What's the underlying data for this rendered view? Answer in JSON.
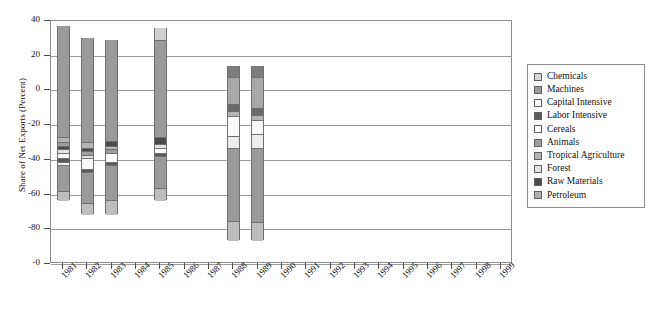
{
  "chart_data": {
    "type": "bar",
    "title": "",
    "subtitle": "",
    "xlabel": "",
    "ylabel": "Share of Net Exports (Percent)",
    "stacked": true,
    "grid": true,
    "legend_position": "right",
    "ylim": [
      -100,
      40
    ],
    "yticks": [
      40,
      20,
      0,
      -20,
      -40,
      -60,
      -80,
      -100
    ],
    "ytick_labels": [
      "40",
      "20",
      "0",
      "-20",
      "-40",
      "-60",
      "-80",
      "-0"
    ],
    "categories": [
      "1981",
      "1982",
      "1983",
      "1984",
      "1985",
      "1986",
      "1987",
      "1988",
      "1989",
      "1990",
      "1991",
      "1992",
      "1993",
      "1994",
      "1995",
      "1996",
      "1997",
      "1998",
      "1999"
    ],
    "series": [
      {
        "name": "Chemicals",
        "color": "#d6d6d6",
        "values": [
          0,
          0,
          0,
          null,
          0,
          null,
          null,
          0,
          0,
          null,
          null,
          null,
          null,
          null,
          null,
          null,
          null,
          null,
          null
        ]
      },
      {
        "name": "Machines",
        "color": "#9a9a9a",
        "values": [
          -67.5,
          -61,
          -62,
          null,
          -58,
          null,
          null,
          -50,
          -52,
          null,
          null,
          null,
          null,
          null,
          null,
          null,
          null,
          null,
          null
        ]
      },
      {
        "name": "Capital Intensive",
        "color": "#f2f2f2",
        "values": [
          0,
          0,
          0,
          null,
          0,
          null,
          null,
          0,
          0,
          null,
          null,
          null,
          null,
          null,
          null,
          null,
          null,
          null,
          null
        ]
      },
      {
        "name": "Labor Intensive",
        "color": "#5a5a5a",
        "values": [
          -2.5,
          -3,
          -3,
          null,
          -3,
          null,
          null,
          -3,
          -3,
          null,
          null,
          null,
          null,
          null,
          null,
          null,
          null,
          null,
          null
        ]
      },
      {
        "name": "Cereals",
        "color": "#fafafa",
        "values": [
          -5,
          -7,
          -6,
          null,
          -3,
          null,
          null,
          -12,
          -12,
          null,
          null,
          null,
          null,
          null,
          null,
          null,
          null,
          null,
          null
        ]
      },
      {
        "name": "Animals",
        "color": "#9e9e9e",
        "values": [
          -2,
          -2,
          -2,
          null,
          -2,
          null,
          null,
          -2,
          -2,
          null,
          null,
          null,
          null,
          null,
          null,
          null,
          null,
          null,
          null
        ]
      },
      {
        "name": "Tropical Agriculture",
        "color": "#b5b5b5",
        "values": [
          -2,
          -2,
          -2,
          null,
          -2,
          null,
          null,
          -2,
          -2,
          null,
          null,
          null,
          null,
          null,
          null,
          null,
          null,
          null,
          null
        ]
      },
      {
        "name": "Forest",
        "color": "#e2e2e2",
        "values": [
          -2,
          -2,
          -2,
          null,
          -2,
          null,
          null,
          -2,
          -2,
          null,
          null,
          null,
          null,
          null,
          null,
          null,
          null,
          null,
          null
        ]
      },
      {
        "name": "Raw Materials",
        "color": "#4a4a4a",
        "values": [
          -2,
          -2,
          -2,
          null,
          -2,
          null,
          null,
          -2,
          -2,
          null,
          null,
          null,
          null,
          null,
          null,
          null,
          null,
          null,
          null
        ]
      },
      {
        "name": "Petroleum",
        "color": "#b0b0b0",
        "values": [
          -17,
          -22,
          -21,
          null,
          -26,
          null,
          null,
          -12,
          -12,
          null,
          null,
          null,
          null,
          null,
          null,
          null,
          null,
          null,
          null
        ]
      }
    ],
    "bars": [
      {
        "year": "1981",
        "top": 37,
        "bottom": -63,
        "segments": [
          {
            "name": "Machines",
            "from": 37,
            "to": -27,
            "color": "#9a9a9a"
          },
          {
            "name": "Tropical Agriculture",
            "from": -27,
            "to": -30,
            "color": "#b5b5b5"
          },
          {
            "name": "Animals",
            "from": -30,
            "to": -32,
            "color": "#9e9e9e"
          },
          {
            "name": "Raw Materials",
            "from": -32,
            "to": -34,
            "color": "#4a4a4a"
          },
          {
            "name": "Forest",
            "from": -34,
            "to": -36,
            "color": "#e2e2e2"
          },
          {
            "name": "Cereals",
            "from": -36,
            "to": -39,
            "color": "#fafafa"
          },
          {
            "name": "Labor Intensive",
            "from": -39,
            "to": -41,
            "color": "#5a5a5a"
          },
          {
            "name": "Capital Intensive",
            "from": -41,
            "to": -43,
            "color": "#f2f2f2"
          },
          {
            "name": "Petroleum",
            "from": -43,
            "to": -58,
            "color": "#9a9a9a"
          },
          {
            "name": "Chemicals",
            "from": -58,
            "to": -63,
            "color": "#bdbdbd"
          }
        ]
      },
      {
        "year": "1982",
        "top": 30,
        "bottom": -71,
        "segments": [
          {
            "name": "Machines",
            "from": 30,
            "to": -30,
            "color": "#9a9a9a"
          },
          {
            "name": "Tropical Agriculture",
            "from": -30,
            "to": -33,
            "color": "#b5b5b5"
          },
          {
            "name": "Raw Materials",
            "from": -33,
            "to": -35,
            "color": "#4a4a4a"
          },
          {
            "name": "Animals",
            "from": -35,
            "to": -37,
            "color": "#9e9e9e"
          },
          {
            "name": "Forest",
            "from": -37,
            "to": -39,
            "color": "#e2e2e2"
          },
          {
            "name": "Cereals",
            "from": -39,
            "to": -45,
            "color": "#fafafa"
          },
          {
            "name": "Labor Intensive",
            "from": -45,
            "to": -47,
            "color": "#5a5a5a"
          },
          {
            "name": "Petroleum",
            "from": -47,
            "to": -65,
            "color": "#9a9a9a"
          },
          {
            "name": "Chemicals",
            "from": -65,
            "to": -71,
            "color": "#bdbdbd"
          }
        ]
      },
      {
        "year": "1983",
        "top": 29,
        "bottom": -71,
        "segments": [
          {
            "name": "Machines",
            "from": 29,
            "to": -29,
            "color": "#9a9a9a"
          },
          {
            "name": "Raw Materials",
            "from": -29,
            "to": -32,
            "color": "#4a4a4a"
          },
          {
            "name": "Tropical Agriculture",
            "from": -32,
            "to": -34,
            "color": "#b5b5b5"
          },
          {
            "name": "Animals",
            "from": -34,
            "to": -36,
            "color": "#9e9e9e"
          },
          {
            "name": "Cereals",
            "from": -36,
            "to": -41,
            "color": "#fafafa"
          },
          {
            "name": "Labor Intensive",
            "from": -41,
            "to": -43,
            "color": "#5a5a5a"
          },
          {
            "name": "Petroleum",
            "from": -43,
            "to": -63,
            "color": "#9a9a9a"
          },
          {
            "name": "Chemicals",
            "from": -63,
            "to": -71,
            "color": "#bdbdbd"
          }
        ]
      },
      {
        "year": "1985",
        "top": 36,
        "bottom": -63,
        "segments": [
          {
            "name": "Chemicals",
            "from": 36,
            "to": 29,
            "color": "#cfcfcf"
          },
          {
            "name": "Machines",
            "from": 29,
            "to": -27,
            "color": "#9a9a9a"
          },
          {
            "name": "Raw Materials",
            "from": -27,
            "to": -31,
            "color": "#4a4a4a"
          },
          {
            "name": "Forest",
            "from": -31,
            "to": -33,
            "color": "#e2e2e2"
          },
          {
            "name": "Cereals",
            "from": -33,
            "to": -36,
            "color": "#fafafa"
          },
          {
            "name": "Labor Intensive",
            "from": -36,
            "to": -38,
            "color": "#5a5a5a"
          },
          {
            "name": "Petroleum",
            "from": -38,
            "to": -56,
            "color": "#9a9a9a"
          },
          {
            "name": "Animals",
            "from": -56,
            "to": -63,
            "color": "#bdbdbd"
          }
        ]
      },
      {
        "year": "1988",
        "top": 14,
        "bottom": -86,
        "segments": [
          {
            "name": "Machines",
            "from": 14,
            "to": 8,
            "color": "#7d7d7d"
          },
          {
            "name": "Chemicals",
            "from": 8,
            "to": -8,
            "color": "#a8a8a8"
          },
          {
            "name": "Raw Materials",
            "from": -8,
            "to": -12,
            "color": "#6a6a6a"
          },
          {
            "name": "Tropical Agriculture",
            "from": -12,
            "to": -15,
            "color": "#b5b5b5"
          },
          {
            "name": "Cereals",
            "from": -15,
            "to": -26,
            "color": "#fafafa"
          },
          {
            "name": "Capital Intensive",
            "from": -26,
            "to": -33,
            "color": "#ededed"
          },
          {
            "name": "Petroleum",
            "from": -33,
            "to": -75,
            "color": "#9a9a9a"
          },
          {
            "name": "Animals",
            "from": -75,
            "to": -86,
            "color": "#bdbdbd"
          }
        ]
      },
      {
        "year": "1989",
        "top": 14,
        "bottom": -86,
        "segments": [
          {
            "name": "Machines",
            "from": 14,
            "to": 8,
            "color": "#7d7d7d"
          },
          {
            "name": "Chemicals",
            "from": 8,
            "to": -10,
            "color": "#a8a8a8"
          },
          {
            "name": "Raw Materials",
            "from": -10,
            "to": -14,
            "color": "#6a6a6a"
          },
          {
            "name": "Tropical Agriculture",
            "from": -14,
            "to": -17,
            "color": "#b5b5b5"
          },
          {
            "name": "Cereals",
            "from": -17,
            "to": -25,
            "color": "#fafafa"
          },
          {
            "name": "Capital Intensive",
            "from": -25,
            "to": -33,
            "color": "#ededed"
          },
          {
            "name": "Petroleum",
            "from": -33,
            "to": -76,
            "color": "#9a9a9a"
          },
          {
            "name": "Animals",
            "from": -76,
            "to": -86,
            "color": "#bdbdbd"
          }
        ]
      }
    ]
  },
  "legend": {
    "items": [
      {
        "label": "Chemicals",
        "color": "#d6d6d6"
      },
      {
        "label": "Machines",
        "color": "#9a9a9a"
      },
      {
        "label": "Capital Intensive",
        "color": "#fcfcfc"
      },
      {
        "label": "Labor Intensive",
        "color": "#5a5a5a"
      },
      {
        "label": "Cereals",
        "color": "#ffffff"
      },
      {
        "label": "Animals",
        "color": "#9e9e9e"
      },
      {
        "label": "Tropical Agriculture",
        "color": "#b5b5b5"
      },
      {
        "label": "Forest",
        "color": "#e2e2e2"
      },
      {
        "label": "Raw Materials",
        "color": "#4a4a4a"
      },
      {
        "label": "Petroleum",
        "color": "#b0b0b0"
      }
    ]
  }
}
